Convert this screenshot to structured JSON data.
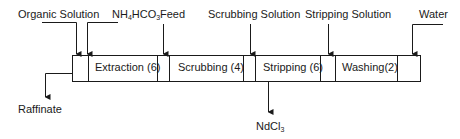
{
  "diagram": {
    "inputs": [
      {
        "id": "organic",
        "label": "Organic Solution"
      },
      {
        "id": "nh4hco3",
        "label_parts": [
          "NH",
          "4",
          "HCO",
          "3"
        ]
      },
      {
        "id": "feed",
        "label": "Feed"
      },
      {
        "id": "scrub",
        "label": "Scrubbing Solution"
      },
      {
        "id": "strip",
        "label": "Stripping Solution"
      },
      {
        "id": "water",
        "label": "Water"
      }
    ],
    "stages": [
      {
        "id": "extraction",
        "label": "Extraction (6)"
      },
      {
        "id": "scrubbing",
        "label": "Scrubbing (4)"
      },
      {
        "id": "stripping",
        "label": "Stripping (6)"
      },
      {
        "id": "washing",
        "label": "Washing(2)"
      }
    ],
    "outputs": [
      {
        "id": "raffinate",
        "label": "Raffinate"
      },
      {
        "id": "ndcl3",
        "label_parts": [
          "NdCl",
          "3"
        ]
      }
    ],
    "colors": {
      "line": "#1a1a1a",
      "background": "#ffffff"
    }
  }
}
